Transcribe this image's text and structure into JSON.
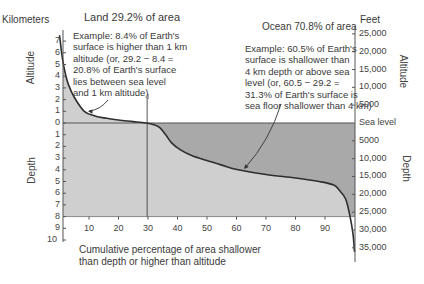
{
  "chart_data": {
    "type": "area",
    "xlabel": "Cumulative percentage of area shallower than depth or higher than altitude",
    "left_axis_unit": "Kilometers",
    "right_axis_unit": "Feet",
    "left_axis_upper_label": "Altitude",
    "left_axis_lower_label": "Depth",
    "right_axis_upper_label": "Altitude",
    "right_axis_lower_label": "Depth",
    "x_ticks": [
      10,
      20,
      30,
      40,
      50,
      60,
      70,
      80,
      90
    ],
    "xlim": [
      0,
      100
    ],
    "km_ticks_altitude": [
      7,
      6,
      5,
      4,
      3,
      2,
      1,
      0
    ],
    "km_ticks_depth": [
      1,
      2,
      3,
      4,
      5,
      6,
      7,
      8,
      9,
      10
    ],
    "feet_ticks_altitude": [
      "25,000",
      "20,000",
      "15,000",
      "10,000",
      "5000"
    ],
    "feet_sea_level_label": "Sea level",
    "feet_ticks_depth": [
      "5000",
      "10,000",
      "15,000",
      "20,000",
      "25,000",
      "30,000",
      "35,000"
    ],
    "ylim_km": [
      -10.5,
      7.5
    ],
    "series": [
      {
        "name": "Hypsographic curve (km; positive = altitude, negative = depth)",
        "x": [
          0,
          1,
          2,
          3,
          5,
          8.4,
          12,
          16,
          20,
          25,
          29.2,
          32,
          34,
          36,
          38,
          41,
          45,
          50,
          55,
          60.5,
          70,
          80,
          88,
          93,
          95,
          97,
          98.5,
          99.5,
          100
        ],
        "y": [
          7.5,
          5.5,
          4.2,
          3.3,
          2.2,
          1.0,
          0.6,
          0.4,
          0.25,
          0.12,
          0,
          -0.15,
          -0.4,
          -1.0,
          -1.7,
          -2.3,
          -2.8,
          -3.2,
          -3.6,
          -4.0,
          -4.4,
          -4.7,
          -5.0,
          -5.3,
          -5.8,
          -6.5,
          -8.0,
          -9.5,
          -11.0
        ]
      }
    ],
    "reference_line_x": 29.2,
    "annotations": [
      {
        "label": "Land 29.2% of area"
      },
      {
        "label": "Ocean 70.8% of area"
      },
      {
        "label": "Example: 8.4% of Earth's surface is higher than 1 km altitude (or, 29.2 − 8.4 = 20.8% of Earth's surface lies between sea level and 1 km altitude)",
        "points_to_x": 8.4,
        "points_to_y_km": 1
      },
      {
        "label": "Example: 60.5% of Earth's surface is shallower than 4 km depth or above sea level (or, 60.5 − 29.2 = 31.3% of Earth's surface is sea floor shallower than 4 km)",
        "points_to_x": 60.5,
        "points_to_y_km": -4
      }
    ],
    "colors": {
      "ocean_band": "#a9a9a9",
      "under_curve": "#cfcfcf",
      "line": "#2e2e2e"
    }
  },
  "text": {
    "kilometers": "Kilometers",
    "feet": "Feet",
    "land_title": "Land 29.2% of area",
    "ocean_title": "Ocean 70.8% of area",
    "land_example": [
      "Example:  8.4% of Earth's",
      "surface is higher than 1 km",
      "altitude (or, 29.2 − 8.4 =",
      "20.8% of Earth's surface",
      "lies between sea level",
      "and 1 km altitude)"
    ],
    "ocean_example": [
      "Example:  60.5% of Earth's",
      "surface is shallower than",
      "4 km depth or above sea",
      "level (or, 60.5 − 29.2 =",
      "31.3% of Earth's surface is",
      "sea floor shallower than 4 km)"
    ],
    "xlabel_lines": [
      "Cumulative percentage of area shallower",
      "than depth or higher than altitude"
    ],
    "altitude": "Altitude",
    "depth": "Depth"
  }
}
